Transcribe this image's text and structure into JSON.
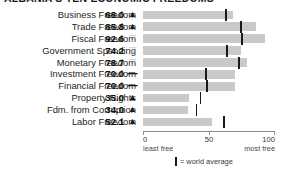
{
  "title": "ALBANIA'S TEN ECONOMIC FREEDOMS",
  "legend": {
    "marker_icon": "vertical-bar-icon",
    "text": "= world average"
  },
  "axis": {
    "ticks": [
      {
        "value": 0,
        "label": "0"
      },
      {
        "value": 50,
        "label": "50"
      },
      {
        "value": 100,
        "label": "100"
      }
    ],
    "left_label": "least free",
    "right_label": "most free",
    "min": 0,
    "max": 100
  },
  "colors": {
    "bar": "#c9c9c9",
    "average_marker": "#1a1a1a",
    "axis": "#8d8d8d",
    "text": "#231f20",
    "trend_down": "#b9b9b9"
  },
  "chart_data": {
    "type": "bar",
    "title": "ALBANIA'S TEN ECONOMIC FREEDOMS",
    "xlabel": "",
    "ylabel": "",
    "xlim": [
      0,
      100
    ],
    "grid": false,
    "orientation": "horizontal",
    "legend_position": "bottom",
    "categories": [
      "Business Freedom",
      "Trade Freedom",
      "Fiscal Freedom",
      "Government Spending",
      "Monetary Freedom",
      "Investment Freedom",
      "Financial Freedom",
      "Property Rights",
      "Fdm. from Corruption",
      "Labor Freedom"
    ],
    "values": [
      68.0,
      85.8,
      92.6,
      74.2,
      78.7,
      70.0,
      70.0,
      35.0,
      34.0,
      52.1
    ],
    "value_labels": [
      "68.0",
      "85.8",
      "92.6",
      "74.2",
      "78.7",
      "70.0",
      "70.0",
      "35.0",
      "34.0",
      "52.1"
    ],
    "trends": [
      "up",
      "up",
      "down",
      "down",
      "down",
      "flat",
      "flat",
      "up",
      "up",
      "up"
    ],
    "trend_glyphs": [
      "▲",
      "▲",
      "▽",
      "▽",
      "▽",
      "—",
      "—",
      "▲",
      "▲",
      "▲"
    ],
    "world_average": [
      63.0,
      74.5,
      74.8,
      63.8,
      73.0,
      48.0,
      48.5,
      43.5,
      40.5,
      61.5
    ],
    "series": [
      {
        "name": "Albania score",
        "values": [
          68.0,
          85.8,
          92.6,
          74.2,
          78.7,
          70.0,
          70.0,
          35.0,
          34.0,
          52.1
        ]
      },
      {
        "name": "world average",
        "values": [
          63.0,
          74.5,
          74.8,
          63.8,
          73.0,
          48.0,
          48.5,
          43.5,
          40.5,
          61.5
        ]
      }
    ]
  }
}
